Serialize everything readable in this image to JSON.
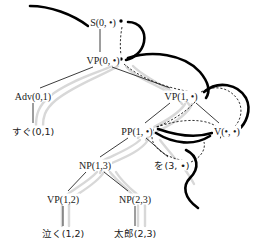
{
  "figure": {
    "type": "parse-tree-diagram",
    "width": 254,
    "height": 247,
    "background_color": "#ffffff",
    "ink_color": "#1a1a1a",
    "thick_curve_color": "#000000",
    "ribbon_color": "#d8d8d8",
    "dot_glyph": "•"
  },
  "nodes": {
    "s": {
      "label": "S(0, •)",
      "x": 103,
      "y": 22
    },
    "vp0": {
      "label": "VP(0, •)",
      "x": 103,
      "y": 60
    },
    "adv": {
      "label": "Adv(0,1)",
      "x": 33,
      "y": 96
    },
    "sugu": {
      "label": "すぐ(0,1)",
      "x": 33,
      "y": 131
    },
    "vp1": {
      "label": "VP(1, •)",
      "x": 181,
      "y": 96
    },
    "pp": {
      "label": "PP(1, •)",
      "x": 137,
      "y": 131
    },
    "v": {
      "label": "V(•, •)",
      "x": 227,
      "y": 131
    },
    "np13": {
      "label": "NP(1,3)",
      "x": 95,
      "y": 165
    },
    "wo": {
      "label": "を(3, •)",
      "x": 172,
      "y": 165
    },
    "vp12": {
      "label": "VP(1,2)",
      "x": 63,
      "y": 199
    },
    "np23": {
      "label": "NP(2,3)",
      "x": 135,
      "y": 199
    },
    "naku": {
      "label": "泣く(1,2)",
      "x": 63,
      "y": 233
    },
    "taro": {
      "label": "太郎(2,3)",
      "x": 135,
      "y": 233
    }
  },
  "tree_edges": [
    {
      "name": "s-to-vp0",
      "from": "s",
      "to": "vp0"
    },
    {
      "name": "vp0-to-adv",
      "from": "vp0",
      "to": "adv"
    },
    {
      "name": "vp0-to-vp1",
      "from": "vp0",
      "to": "vp1"
    },
    {
      "name": "adv-to-sugu",
      "from": "adv",
      "to": "sugu"
    },
    {
      "name": "vp1-to-pp",
      "from": "vp1",
      "to": "pp"
    },
    {
      "name": "vp1-to-v",
      "from": "vp1",
      "to": "v"
    },
    {
      "name": "pp-to-np13",
      "from": "pp",
      "to": "np13"
    },
    {
      "name": "pp-to-wo",
      "from": "pp",
      "to": "wo"
    },
    {
      "name": "np13-to-vp12",
      "from": "np13",
      "to": "vp12"
    },
    {
      "name": "np13-to-np23",
      "from": "np13",
      "to": "np23"
    },
    {
      "name": "vp12-to-naku",
      "from": "vp12",
      "to": "naku"
    },
    {
      "name": "np23-to-taro",
      "from": "np23",
      "to": "taro"
    }
  ],
  "dot_points": [
    {
      "name": "dot-s",
      "x": 121,
      "y": 22
    },
    {
      "name": "dot-vp0",
      "x": 121,
      "y": 60
    },
    {
      "name": "dot-vp1",
      "x": 197,
      "y": 96
    },
    {
      "name": "dot-pp",
      "x": 153,
      "y": 131
    },
    {
      "name": "dot-v-left",
      "x": 222,
      "y": 131
    },
    {
      "name": "dot-v-right",
      "x": 234,
      "y": 131
    },
    {
      "name": "dot-wo",
      "x": 188,
      "y": 165
    }
  ]
}
